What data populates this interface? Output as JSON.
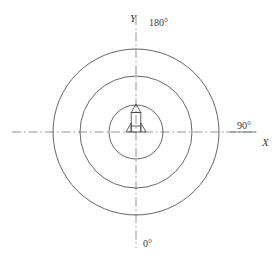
{
  "figure": {
    "type": "polar-coverage-diagram",
    "background_color": "#ffffff",
    "line_color": "#555555",
    "axis_color": "#777777",
    "text_color": "#3a3a3a"
  },
  "axes": {
    "x_label": "X",
    "y_label": "Y",
    "center": {
      "x": 136,
      "y": 132
    },
    "x_axis": {
      "x1": 12,
      "y1": 132,
      "x2": 258,
      "y2": 132,
      "style": "dash-dot"
    },
    "y_axis": {
      "x1": 136,
      "y1": 16,
      "x2": 136,
      "y2": 248,
      "style": "dash-dot"
    }
  },
  "angle_labels": [
    {
      "name": "bearing-180",
      "text": "180°",
      "position": "top"
    },
    {
      "name": "bearing-90",
      "text": "90°",
      "position": "right"
    },
    {
      "name": "bearing-0",
      "text": "0°",
      "position": "bottom"
    }
  ],
  "circles": [
    {
      "name": "inner-range-ring",
      "cx": 136,
      "cy": 132,
      "r": 27
    },
    {
      "name": "middle-range-ring",
      "cx": 136,
      "cy": 132,
      "r": 56
    },
    {
      "name": "outer-range-ring",
      "cx": 136,
      "cy": 132,
      "r": 83
    }
  ],
  "center_object": {
    "name": "rocket-icon",
    "description": "missile / rocket symbol at origin",
    "cx": 136,
    "base_y": 132,
    "tip_y": 104,
    "body_width": 10
  },
  "chart_data": {
    "type": "scatter",
    "title": "",
    "xlabel": "X",
    "ylabel": "Y",
    "rings": [
      27,
      56,
      83
    ],
    "bearings_deg": [
      0,
      90,
      180
    ],
    "origin": [
      0,
      0
    ],
    "grid": false,
    "legend": "none"
  }
}
